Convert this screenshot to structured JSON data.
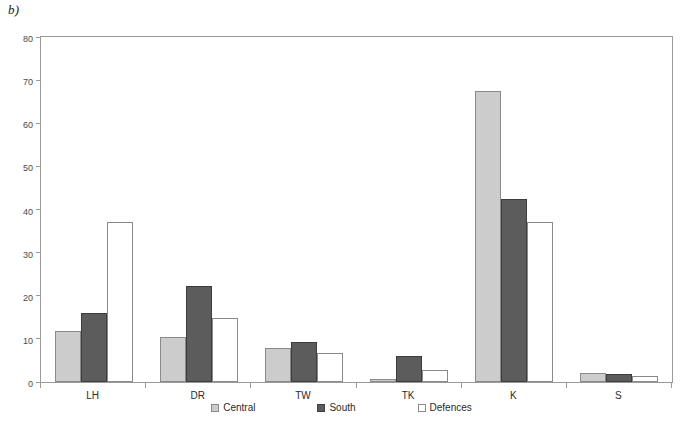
{
  "panel_label": "b)",
  "chart_data": {
    "type": "bar",
    "title": "",
    "subtitle": "",
    "xlabel": "",
    "ylabel": "",
    "ylim": [
      0,
      80
    ],
    "yticks": [
      0,
      10,
      20,
      30,
      40,
      50,
      60,
      70,
      80
    ],
    "ytick_labels": [
      "0",
      "10",
      "20",
      "30",
      "40",
      "50",
      "60",
      "70",
      "80"
    ],
    "grid": false,
    "legend_position": "bottom-center",
    "categories": [
      "LH",
      "DR",
      "TW",
      "TK",
      "K",
      "S"
    ],
    "series": [
      {
        "name": "Central",
        "color": "#cccccc",
        "edge_color": "#8a8a8a",
        "values": [
          11.8,
          10.5,
          8.0,
          0.8,
          67.5,
          2.0
        ]
      },
      {
        "name": "South",
        "color": "#5c5c5c",
        "edge_color": "#3d3d3d",
        "values": [
          16.0,
          22.3,
          9.3,
          6.0,
          42.5,
          1.8
        ]
      },
      {
        "name": "Defences",
        "color": "#ffffff",
        "edge_color": "#8a8a8a",
        "values": [
          37.0,
          14.8,
          6.7,
          2.8,
          37.0,
          1.3
        ]
      }
    ]
  },
  "legend": {
    "items": [
      {
        "label": "Central",
        "swatch": "central-swatch-icon"
      },
      {
        "label": "South",
        "swatch": "south-swatch-icon"
      },
      {
        "label": "Defences",
        "swatch": "defences-swatch-icon"
      }
    ]
  }
}
